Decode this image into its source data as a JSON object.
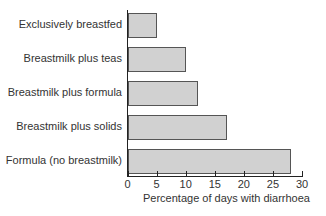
{
  "chart_data": {
    "type": "bar",
    "orientation": "horizontal",
    "title": "",
    "categories": [
      "Exclusively breastfed",
      "Breastmilk plus teas",
      "Breastmilk plus formula",
      "Breastmilk plus solids",
      "Formula (no breastmilk)"
    ],
    "values": [
      5,
      10,
      12,
      17,
      28
    ],
    "xlabel": "Percentage of days with diarrhoea",
    "ylabel": "",
    "xlim": [
      0,
      30
    ],
    "xticks": [
      "0",
      "5",
      "10",
      "15",
      "20",
      "25",
      "30"
    ],
    "grid": false,
    "legend": null,
    "bar_color": "#d1d1d1",
    "bar_edge_color": "#555555"
  }
}
